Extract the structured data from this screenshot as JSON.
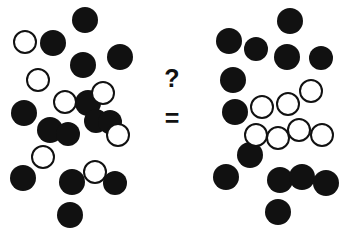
{
  "figure": {
    "width": 347,
    "height": 237,
    "background_color": "#ffffff",
    "filled_dot_color": "#111111",
    "open_dot_stroke_color": "#111111",
    "open_dot_fill_color": "#ffffff"
  },
  "center": {
    "question_symbol": "?",
    "equals_symbol": "="
  },
  "chart_data": {
    "type": "scatter",
    "xlabel": "",
    "ylabel": "",
    "xlim": [
      0,
      347
    ],
    "ylim": [
      0,
      237
    ],
    "grid": false,
    "legend": "none",
    "annotations": [
      "?",
      "="
    ],
    "series": [
      {
        "name": "left-cluster-filled",
        "marker": "filled-circle",
        "color": "#111111",
        "count": 14,
        "points": [
          {
            "x": 85,
            "y": 20,
            "r": 13
          },
          {
            "x": 53,
            "y": 43,
            "r": 13
          },
          {
            "x": 120,
            "y": 57,
            "r": 13
          },
          {
            "x": 83,
            "y": 65,
            "r": 13
          },
          {
            "x": 24,
            "y": 113,
            "r": 13
          },
          {
            "x": 88,
            "y": 103,
            "r": 13
          },
          {
            "x": 96,
            "y": 121,
            "r": 12
          },
          {
            "x": 50,
            "y": 130,
            "r": 13
          },
          {
            "x": 68,
            "y": 134,
            "r": 12
          },
          {
            "x": 110,
            "y": 122,
            "r": 0
          },
          {
            "x": 23,
            "y": 178,
            "r": 13
          },
          {
            "x": 72,
            "y": 182,
            "r": 13
          },
          {
            "x": 115,
            "y": 183,
            "r": 12
          },
          {
            "x": 70,
            "y": 215,
            "r": 13
          }
        ]
      },
      {
        "name": "left-cluster-open",
        "marker": "open-circle",
        "color": "#ffffff",
        "count": 7,
        "points": [
          {
            "x": 25,
            "y": 42,
            "r": 12
          },
          {
            "x": 38,
            "y": 80,
            "r": 12
          },
          {
            "x": 65,
            "y": 102,
            "r": 12
          },
          {
            "x": 103,
            "y": 93,
            "r": 12
          },
          {
            "x": 118,
            "y": 135,
            "r": 12
          },
          {
            "x": 43,
            "y": 157,
            "r": 12
          },
          {
            "x": 95,
            "y": 172,
            "r": 12
          }
        ]
      },
      {
        "name": "right-cluster-filled",
        "marker": "filled-circle",
        "color": "#111111",
        "count": 13,
        "points": [
          {
            "x": 290,
            "y": 21,
            "r": 13
          },
          {
            "x": 229,
            "y": 41,
            "r": 13
          },
          {
            "x": 256,
            "y": 49,
            "r": 12
          },
          {
            "x": 287,
            "y": 57,
            "r": 13
          },
          {
            "x": 321,
            "y": 58,
            "r": 12
          },
          {
            "x": 233,
            "y": 80,
            "r": 13
          },
          {
            "x": 235,
            "y": 112,
            "r": 13
          },
          {
            "x": 250,
            "y": 155,
            "r": 13
          },
          {
            "x": 226,
            "y": 177,
            "r": 13
          },
          {
            "x": 280,
            "y": 180,
            "r": 13
          },
          {
            "x": 302,
            "y": 177,
            "r": 13
          },
          {
            "x": 326,
            "y": 183,
            "r": 13
          },
          {
            "x": 278,
            "y": 212,
            "r": 13
          }
        ]
      },
      {
        "name": "right-cluster-open",
        "marker": "open-circle",
        "color": "#ffffff",
        "count": 7,
        "points": [
          {
            "x": 311,
            "y": 91,
            "r": 12
          },
          {
            "x": 262,
            "y": 107,
            "r": 12
          },
          {
            "x": 288,
            "y": 104,
            "r": 12
          },
          {
            "x": 256,
            "y": 135,
            "r": 12
          },
          {
            "x": 278,
            "y": 138,
            "r": 12
          },
          {
            "x": 299,
            "y": 130,
            "r": 12
          },
          {
            "x": 322,
            "y": 135,
            "r": 12
          }
        ]
      }
    ]
  }
}
